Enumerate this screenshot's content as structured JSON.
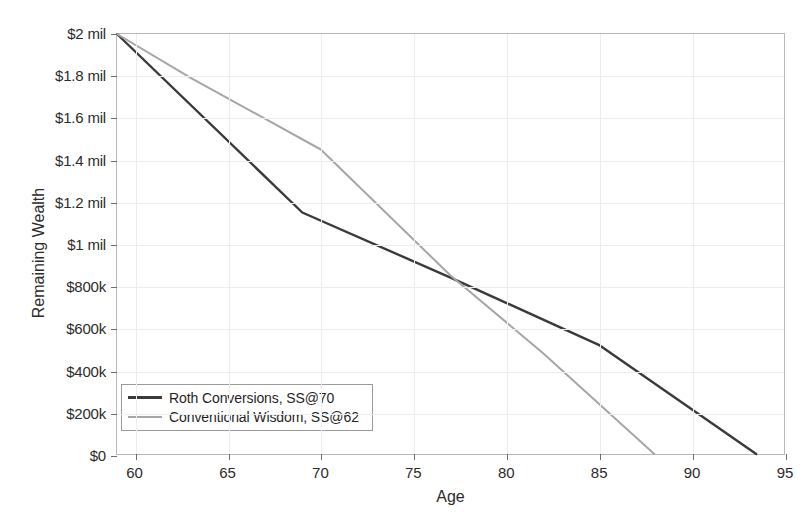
{
  "chart_data": {
    "type": "line",
    "title": "",
    "xlabel": "Age",
    "ylabel": "Remaining Wealth",
    "xlim": [
      59,
      95
    ],
    "ylim": [
      0,
      2000000
    ],
    "grid": true,
    "legend_position": "lower-left",
    "x_ticks": [
      60,
      65,
      70,
      75,
      80,
      85,
      90,
      95
    ],
    "x_tick_labels": [
      "60",
      "65",
      "70",
      "75",
      "80",
      "85",
      "90",
      "95"
    ],
    "y_ticks": [
      0,
      200000,
      400000,
      600000,
      800000,
      1000000,
      1200000,
      1400000,
      1600000,
      1800000,
      2000000
    ],
    "y_tick_labels": [
      "$0",
      "$200k",
      "$400k",
      "$600k",
      "$800k",
      "$1 mil",
      "$1.2 mil",
      "$1.4 mil",
      "$1.6 mil",
      "$1.8 mil",
      "$2 mil"
    ],
    "series": [
      {
        "name": "Roth Conversions, SS@70",
        "color": "#3a3a3a",
        "width": 2.4,
        "points": [
          [
            59,
            2000000
          ],
          [
            69,
            1150000
          ],
          [
            77,
            840000
          ],
          [
            85,
            520000
          ],
          [
            93.5,
            0
          ]
        ]
      },
      {
        "name": "Conventional Wisdom, SS@62",
        "color": "#a6a6a6",
        "width": 2.0,
        "points": [
          [
            59,
            2000000
          ],
          [
            63,
            1790000
          ],
          [
            70,
            1450000
          ],
          [
            77,
            850000
          ],
          [
            82,
            480000
          ],
          [
            88,
            0
          ]
        ]
      }
    ]
  },
  "legend": {
    "entries": [
      {
        "label": "Roth Conversions, SS@70"
      },
      {
        "label": "Conventional Wisdom, SS@62"
      }
    ]
  },
  "colors": {
    "roth_line": "#3a3a3a",
    "conventional_line": "#a6a6a6",
    "axis": "#b9b9b9",
    "grid": "#ededed",
    "text": "#2b2b2b",
    "background": "#ffffff"
  }
}
